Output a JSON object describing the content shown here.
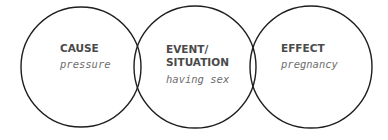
{
  "diagram": {
    "stroke_color": "#1e1e1e",
    "circles": [
      {
        "id": "cause",
        "heading": "CAUSE",
        "example": "pressure"
      },
      {
        "id": "event",
        "heading_line1": "EVENT/",
        "heading_line2": "SITUATION",
        "example": "having sex"
      },
      {
        "id": "effect",
        "heading": "EFFECT",
        "example": "pregnancy"
      }
    ]
  }
}
